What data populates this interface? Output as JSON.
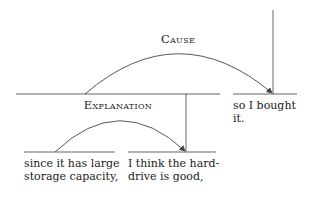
{
  "relations": [
    {
      "id": "cause",
      "label": "Cause"
    },
    {
      "id": "explanation",
      "label": "Explanation"
    }
  ],
  "segments": [
    {
      "id": "seg1",
      "lines": [
        "since it has large",
        "storage capacity,"
      ]
    },
    {
      "id": "seg2",
      "lines": [
        "I think the hard-",
        "drive is good,"
      ]
    },
    {
      "id": "seg3",
      "lines": [
        "so I bought",
        "it."
      ]
    }
  ],
  "colors": {
    "line": "#444444",
    "text": "#222222"
  }
}
